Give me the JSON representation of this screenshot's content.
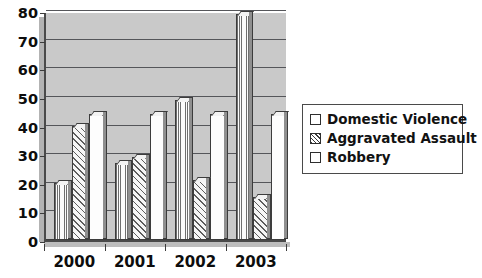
{
  "chart_data": {
    "type": "bar",
    "title": "",
    "subtitle": "",
    "xlabel": "",
    "ylabel": "",
    "categories": [
      "2000",
      "2001",
      "2002",
      "2003"
    ],
    "series": [
      {
        "name": "Domestic Violence",
        "values": [
          20,
          27,
          49,
          79
        ],
        "pattern": "vertical-lines",
        "color": "#f4f4f4"
      },
      {
        "name": "Aggravated Assault",
        "values": [
          40,
          29,
          21,
          15
        ],
        "pattern": "diagonal-hatch",
        "color": "#f0f0f0"
      },
      {
        "name": "Robbery",
        "values": [
          44,
          44,
          44,
          44
        ],
        "pattern": "solid",
        "color": "#fdfdfd"
      }
    ],
    "ylim": [
      0,
      80
    ],
    "yticks": [
      0,
      10,
      20,
      30,
      40,
      50,
      60,
      70,
      80
    ],
    "ytick_labels": [
      "0",
      "10",
      "20",
      "30",
      "40",
      "50",
      "60",
      "70",
      "80"
    ],
    "grid": true,
    "grid_axis": "y",
    "legend_position": "right",
    "style": "3d-bar",
    "plot_background": "#c9c9c9",
    "grid_color": "#55565a",
    "axis_color": "#3b3b3b",
    "text_color": "#0d0d0d"
  },
  "legend": {
    "items": [
      {
        "label": "Domestic Violence",
        "swatch": "legend-swatch-domestic-violence"
      },
      {
        "label": "Aggravated Assault",
        "swatch": "legend-swatch-aggravated-assault"
      },
      {
        "label": "Robbery",
        "swatch": "legend-swatch-robbery"
      }
    ]
  }
}
